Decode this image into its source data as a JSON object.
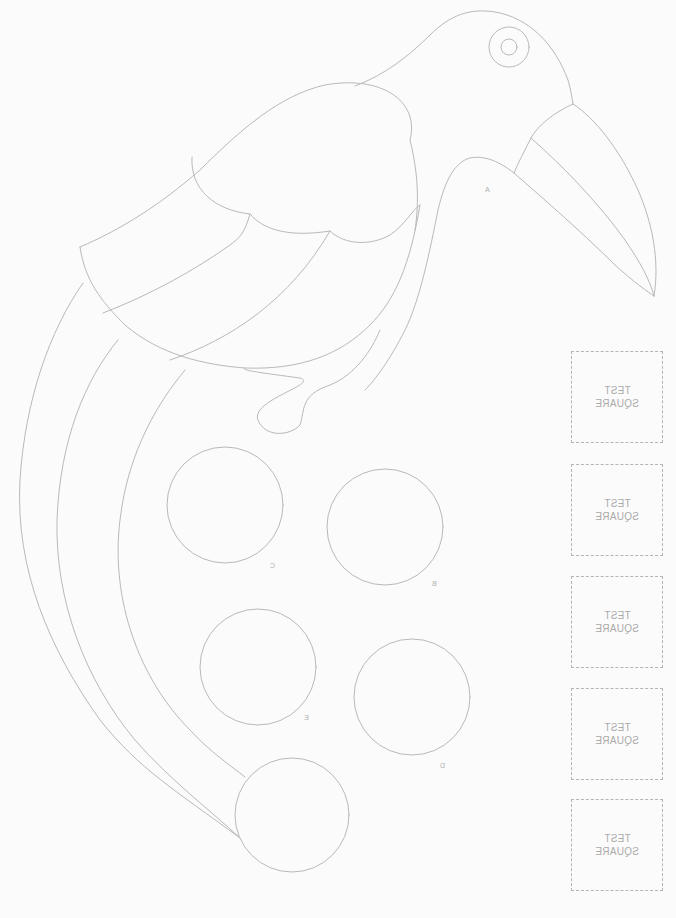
{
  "template": {
    "subject": "toucan bird pattern",
    "mirrored": true,
    "line_color": "#b9b9b9",
    "background_color": "#fbfbfb"
  },
  "test_squares": [
    {
      "line1": "TEST",
      "line2": "SQUARE"
    },
    {
      "line1": "TEST",
      "line2": "SQUARE"
    },
    {
      "line1": "TEST",
      "line2": "SQUARE"
    },
    {
      "line1": "TEST",
      "line2": "SQUARE"
    },
    {
      "line1": "TEST",
      "line2": "SQUARE"
    }
  ],
  "markers": {
    "a": "A",
    "b": "B",
    "c": "C",
    "d": "D",
    "e": "E"
  },
  "circles": [
    {
      "id": "c",
      "cx": 225,
      "cy": 505,
      "r": 58
    },
    {
      "id": "b",
      "cx": 385,
      "cy": 527,
      "r": 58
    },
    {
      "id": "e",
      "cx": 258,
      "cy": 667,
      "r": 58
    },
    {
      "id": "d",
      "cx": 412,
      "cy": 697,
      "r": 58
    },
    {
      "id": "tail-end",
      "cx": 292,
      "cy": 815,
      "r": 57
    }
  ]
}
